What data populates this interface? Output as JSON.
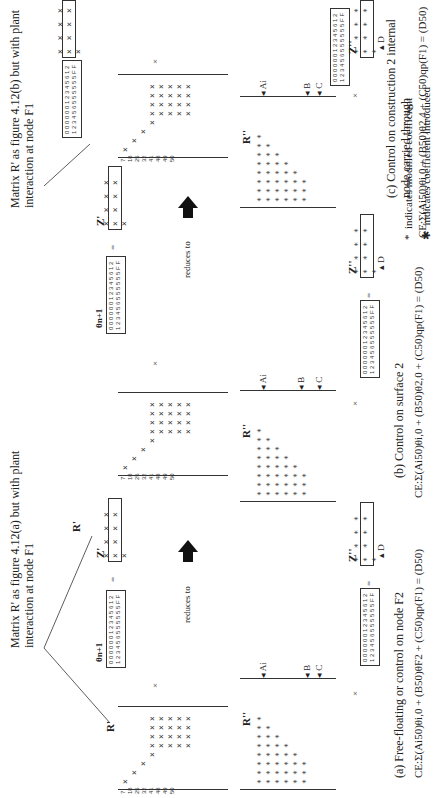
{
  "notes": {
    "top_a": "Matrix R' as figure 4.12(a) but with plant interaction at node F1",
    "top_b": "Matrix R' as figure 4.12(b) but with plant interaction at node F1"
  },
  "reduces_to": [
    "reduces to",
    "reduces to"
  ],
  "row_labels": [
    "7",
    "18",
    "25",
    "32",
    "41",
    "48",
    "49",
    "50"
  ],
  "theta": {
    "label": "θn+1",
    "row1": "0 0 0 0 0 0 1 2 3 4 5 6 1 2",
    "row2": "1 2 3 4 5 6 5 5 5 5 5 5 F F",
    "q": "qp"
  },
  "operators": {
    "times": "×",
    "equals": "="
  },
  "upper": [
    {
      "r_label": "R'",
      "z_label": "Z'",
      "z_values": "× × × × × × × × ×"
    },
    {
      "r_label": "R'",
      "z_label": "Z'",
      "z_values": "× × × × × × × × ×"
    }
  ],
  "panels": [
    {
      "caption": "(a)  Free-floating or control on node F2",
      "r_label": "R''",
      "z_label": "Z''",
      "z_values": "* * * * * * * * *",
      "arrows": {
        "ai": "Ai",
        "b": "B",
        "c": "C",
        "d": "D"
      },
      "equation": "CE:Σ(Ai50)θi,0 + (B50)θF2 + (C50)qp(F1) = (D50)"
    },
    {
      "caption": "(b)  Control on surface 2",
      "r_label": "R''",
      "z_label": "Z''",
      "z_values": "* * * * * * * * *",
      "arrows": {
        "ai": "Ai",
        "b": "B",
        "c": "C",
        "d": "D"
      },
      "equation": "CE:Σ(Ai50)θi,0 + (B50)θ2,0 + (C50)qp(F1) = (D50)"
    },
    {
      "caption": "(c)  Control on construction 2 internal node carried through",
      "r_label": "R''",
      "z_label": "Z''",
      "z_values": "* * * * * * * * *",
      "arrows": {
        "ai": "Ai",
        "b": "B",
        "c": "C",
        "d": "D"
      },
      "equation": "CE:Σ(Ai50)θi,0 + (B50)θ2,4 + (C50)qp(F1) = (D50)"
    }
  ],
  "legend": [
    {
      "symbol": "*",
      "text": "indicates modified coefficient"
    },
    {
      "symbol": "✱",
      "text": "indicates coefficient introduced"
    }
  ]
}
